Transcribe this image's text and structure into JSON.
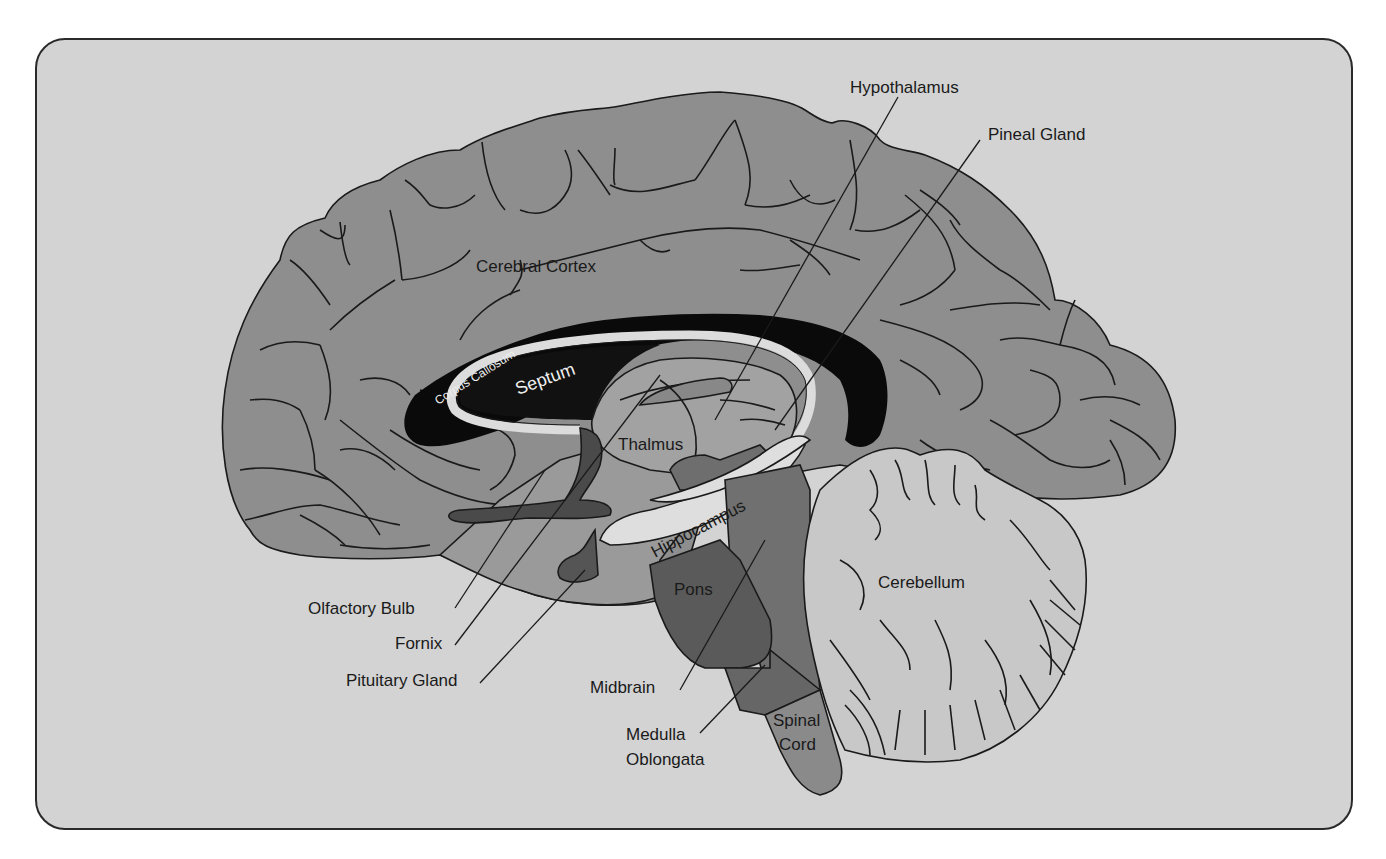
{
  "diagram": {
    "type": "anatomical-diagram",
    "colors": {
      "background": "#d3d3d3",
      "frame_border": "#2a2a2a",
      "cortex": "#8e8e8e",
      "corpus_callosum": "#0a0a0a",
      "fornix_band": "#dcdcdc",
      "thalamus": "#a2a2a2",
      "dark_structures": "#4a4a4a",
      "pons": "#5a5a5a",
      "midbrain": "#707070",
      "spinal_cord": "#8a8a8a",
      "cerebellum": "#c8c8c8",
      "hippocampus": "#dedede"
    },
    "labels": {
      "hypothalamus": "Hypothalamus",
      "pineal_gland": "Pineal Gland",
      "cerebral_cortex": "Cerebral Cortex",
      "corpus_callosum": "Corpus Callosum",
      "septum": "Septum",
      "thalmus": "Thalmus",
      "hippocampus": "Hippocampus",
      "cerebellum": "Cerebellum",
      "pons": "Pons",
      "olfactory_bulb": "Olfactory Bulb",
      "fornix": "Fornix",
      "pituitary_gland": "Pituitary Gland",
      "midbrain": "Midbrain",
      "medulla_line1": "Medulla",
      "medulla_line2": "Oblongata",
      "spinal_line1": "Spinal",
      "spinal_line2": "Cord"
    }
  }
}
